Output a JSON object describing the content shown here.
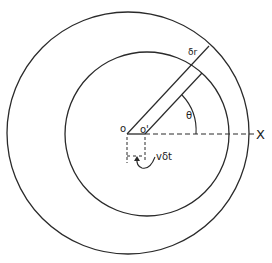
{
  "diagram": {
    "labels": {
      "origin": "o",
      "shifted_origin": "o'",
      "radial_increment": "δr",
      "angle": "θ",
      "axis": "X",
      "displacement": "vδt"
    },
    "colors": {
      "stroke": "#2a2a2a",
      "background": "#ffffff"
    }
  }
}
